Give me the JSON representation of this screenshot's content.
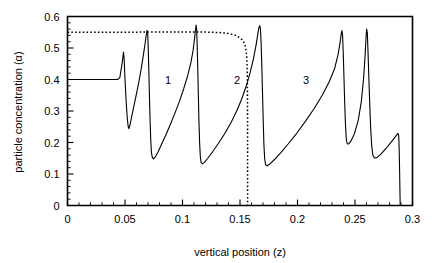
{
  "chart_data": {
    "type": "line",
    "title": "",
    "xlabel": "vertical position (z)",
    "ylabel": "particle concentration (α)",
    "xlim": [
      0,
      0.3
    ],
    "ylim": [
      0,
      0.6
    ],
    "xticks": [
      "0",
      "0.05",
      "0.1",
      "0.15",
      "0.2",
      "0.25",
      "0.3"
    ],
    "xtick_values": [
      0,
      0.05,
      0.1,
      0.15,
      0.2,
      0.25,
      0.3
    ],
    "yticks": [
      "0",
      "0.1",
      "0.2",
      "0.3",
      "0.4",
      "0.5",
      "0.6"
    ],
    "ytick_values": [
      0,
      0.1,
      0.2,
      0.3,
      0.4,
      0.5,
      0.6
    ],
    "minor_ticks_per_interval": 5,
    "grid": false,
    "legend": "none",
    "annotations": [
      {
        "text": "1",
        "x": 0.0875,
        "y": 0.4
      },
      {
        "text": "2",
        "x": 0.1475,
        "y": 0.4
      },
      {
        "text": "3",
        "x": 0.2075,
        "y": 0.4
      }
    ],
    "series": [
      {
        "name": "particle concentration profile",
        "style": "solid",
        "color": "#000000",
        "points": [
          [
            0.0,
            0.4
          ],
          [
            0.0435,
            0.4
          ],
          [
            0.0455,
            0.406
          ],
          [
            0.0475,
            0.452
          ],
          [
            0.0487,
            0.487
          ],
          [
            0.0492,
            0.47
          ],
          [
            0.05,
            0.4
          ],
          [
            0.051,
            0.33
          ],
          [
            0.052,
            0.276
          ],
          [
            0.0528,
            0.25
          ],
          [
            0.0534,
            0.244
          ],
          [
            0.0545,
            0.258
          ],
          [
            0.056,
            0.285
          ],
          [
            0.058,
            0.32
          ],
          [
            0.06,
            0.355
          ],
          [
            0.062,
            0.392
          ],
          [
            0.064,
            0.432
          ],
          [
            0.066,
            0.478
          ],
          [
            0.0675,
            0.515
          ],
          [
            0.0685,
            0.542
          ],
          [
            0.0692,
            0.556
          ],
          [
            0.0697,
            0.548
          ],
          [
            0.0702,
            0.5
          ],
          [
            0.0707,
            0.43
          ],
          [
            0.0712,
            0.355
          ],
          [
            0.0718,
            0.272
          ],
          [
            0.0724,
            0.205
          ],
          [
            0.073,
            0.168
          ],
          [
            0.0738,
            0.152
          ],
          [
            0.0748,
            0.148
          ],
          [
            0.0765,
            0.155
          ],
          [
            0.079,
            0.172
          ],
          [
            0.082,
            0.196
          ],
          [
            0.0855,
            0.224
          ],
          [
            0.0895,
            0.258
          ],
          [
            0.0935,
            0.294
          ],
          [
            0.0975,
            0.332
          ],
          [
            0.101,
            0.37
          ],
          [
            0.1045,
            0.412
          ],
          [
            0.1072,
            0.452
          ],
          [
            0.1092,
            0.492
          ],
          [
            0.1105,
            0.53
          ],
          [
            0.1113,
            0.558
          ],
          [
            0.1118,
            0.573
          ],
          [
            0.1123,
            0.56
          ],
          [
            0.1128,
            0.505
          ],
          [
            0.1133,
            0.43
          ],
          [
            0.1138,
            0.348
          ],
          [
            0.1143,
            0.268
          ],
          [
            0.1149,
            0.198
          ],
          [
            0.1155,
            0.155
          ],
          [
            0.1162,
            0.136
          ],
          [
            0.1172,
            0.132
          ],
          [
            0.119,
            0.137
          ],
          [
            0.122,
            0.15
          ],
          [
            0.126,
            0.17
          ],
          [
            0.131,
            0.196
          ],
          [
            0.1365,
            0.227
          ],
          [
            0.142,
            0.262
          ],
          [
            0.147,
            0.299
          ],
          [
            0.1515,
            0.338
          ],
          [
            0.1555,
            0.38
          ],
          [
            0.159,
            0.424
          ],
          [
            0.1618,
            0.468
          ],
          [
            0.164,
            0.51
          ],
          [
            0.1655,
            0.545
          ],
          [
            0.1665,
            0.566
          ],
          [
            0.1672,
            0.571
          ],
          [
            0.1678,
            0.56
          ],
          [
            0.1684,
            0.512
          ],
          [
            0.169,
            0.44
          ],
          [
            0.1696,
            0.355
          ],
          [
            0.1702,
            0.268
          ],
          [
            0.1708,
            0.192
          ],
          [
            0.1715,
            0.146
          ],
          [
            0.1723,
            0.129
          ],
          [
            0.1735,
            0.126
          ],
          [
            0.176,
            0.132
          ],
          [
            0.18,
            0.146
          ],
          [
            0.1855,
            0.168
          ],
          [
            0.192,
            0.196
          ],
          [
            0.1995,
            0.23
          ],
          [
            0.207,
            0.268
          ],
          [
            0.2145,
            0.308
          ],
          [
            0.2215,
            0.35
          ],
          [
            0.2275,
            0.392
          ],
          [
            0.2322,
            0.434
          ],
          [
            0.2352,
            0.478
          ],
          [
            0.237,
            0.516
          ],
          [
            0.238,
            0.545
          ],
          [
            0.2386,
            0.555
          ],
          [
            0.2392,
            0.54
          ],
          [
            0.2398,
            0.482
          ],
          [
            0.2404,
            0.408
          ],
          [
            0.241,
            0.33
          ],
          [
            0.2417,
            0.258
          ],
          [
            0.2424,
            0.213
          ],
          [
            0.2432,
            0.196
          ],
          [
            0.2444,
            0.195
          ],
          [
            0.2465,
            0.205
          ],
          [
            0.2495,
            0.228
          ],
          [
            0.2528,
            0.27
          ],
          [
            0.2555,
            0.33
          ],
          [
            0.2575,
            0.405
          ],
          [
            0.2588,
            0.478
          ],
          [
            0.2596,
            0.535
          ],
          [
            0.2601,
            0.56
          ],
          [
            0.2607,
            0.548
          ],
          [
            0.2613,
            0.49
          ],
          [
            0.262,
            0.41
          ],
          [
            0.2628,
            0.325
          ],
          [
            0.2636,
            0.248
          ],
          [
            0.2645,
            0.19
          ],
          [
            0.2655,
            0.16
          ],
          [
            0.2668,
            0.151
          ],
          [
            0.269,
            0.152
          ],
          [
            0.2725,
            0.163
          ],
          [
            0.277,
            0.181
          ],
          [
            0.2818,
            0.203
          ],
          [
            0.2858,
            0.222
          ],
          [
            0.2874,
            0.229
          ],
          [
            0.288,
            0.222
          ],
          [
            0.2884,
            0.18
          ],
          [
            0.2888,
            0.11
          ],
          [
            0.2891,
            0.04
          ],
          [
            0.2893,
            0.0
          ]
        ]
      },
      {
        "name": "reference profile",
        "style": "dotted",
        "color": "#000000",
        "points": [
          [
            0.0,
            0.55
          ],
          [
            0.02,
            0.55
          ],
          [
            0.05,
            0.55
          ],
          [
            0.08,
            0.551
          ],
          [
            0.1,
            0.551
          ],
          [
            0.115,
            0.551
          ],
          [
            0.125,
            0.55
          ],
          [
            0.132,
            0.549
          ],
          [
            0.138,
            0.547
          ],
          [
            0.1425,
            0.544
          ],
          [
            0.1462,
            0.54
          ],
          [
            0.1492,
            0.534
          ],
          [
            0.1516,
            0.527
          ],
          [
            0.1534,
            0.518
          ],
          [
            0.1546,
            0.506
          ],
          [
            0.1554,
            0.49
          ],
          [
            0.1559,
            0.468
          ],
          [
            0.1562,
            0.44
          ],
          [
            0.1564,
            0.4
          ],
          [
            0.1565,
            0.34
          ],
          [
            0.1566,
            0.26
          ],
          [
            0.1566,
            0.17
          ],
          [
            0.1566,
            0.08
          ],
          [
            0.1566,
            0.0
          ]
        ]
      }
    ]
  }
}
